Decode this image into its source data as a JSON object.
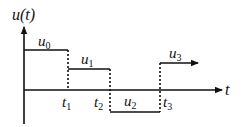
{
  "diagram": {
    "type": "piecewise-constant signal plot",
    "y_axis_label": "u(t)",
    "x_axis_label": "t",
    "colors": {
      "line": "#111111",
      "background": "#ffffff"
    },
    "segments": [
      {
        "label": "u",
        "subscript": "0",
        "from": "0",
        "to": "t1",
        "level": "high"
      },
      {
        "label": "u",
        "subscript": "1",
        "from": "t1",
        "to": "t2",
        "level": "mid-positive"
      },
      {
        "label": "u",
        "subscript": "2",
        "from": "t2",
        "to": "t3",
        "level": "negative"
      },
      {
        "label": "u",
        "subscript": "3",
        "from": "t3",
        "to": "∞",
        "level": "positive",
        "continues": true
      }
    ],
    "time_marks": [
      {
        "label": "t",
        "subscript": "1"
      },
      {
        "label": "t",
        "subscript": "2"
      },
      {
        "label": "t",
        "subscript": "3"
      }
    ]
  }
}
